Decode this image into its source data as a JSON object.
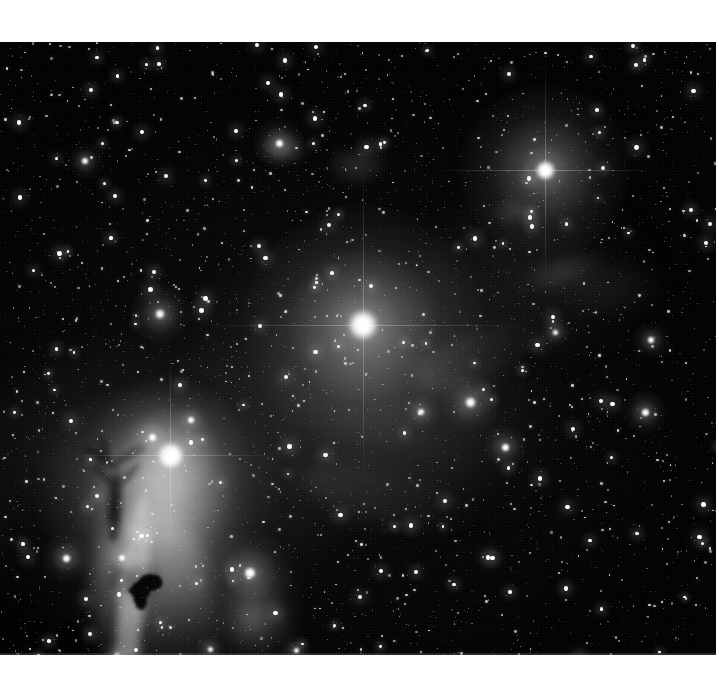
{
  "page": {
    "background_color": "#ffffff",
    "width": 719,
    "height": 699
  },
  "plate": {
    "name": "astrophotograph",
    "subject": "Orion molecular cloud - Flame and Horsehead Nebula region",
    "palette": "grayscale",
    "background_color": "#020202",
    "frame": {
      "x": 0,
      "y": 42,
      "width": 716,
      "height": 613
    },
    "margins": {
      "top": 42,
      "bottom": 44,
      "left": 0,
      "right": 3
    }
  },
  "features": [
    {
      "id": "flame-nebula",
      "label": "Flame Nebula",
      "x": 140,
      "y": 455,
      "kind": "emission-nebula"
    },
    {
      "id": "horsehead-nebula",
      "label": "Horsehead Nebula",
      "x": 145,
      "y": 548,
      "kind": "dark-nebula"
    },
    {
      "id": "ic434-ridge",
      "label": "IC 434 emission ridge",
      "x": 135,
      "y": 500,
      "kind": "emission-ridge"
    },
    {
      "id": "ngc2023",
      "label": "NGC 2023",
      "x": 250,
      "y": 573,
      "kind": "reflection-nebula"
    },
    {
      "id": "bright-star-mid",
      "label": "Bright central star",
      "x": 363,
      "y": 325,
      "kind": "star"
    },
    {
      "id": "bright-star-top",
      "label": "Bright upper-right star",
      "x": 545,
      "y": 170,
      "kind": "star"
    },
    {
      "id": "alnitak",
      "label": "Alnitak",
      "x": 170,
      "y": 455,
      "kind": "star"
    }
  ],
  "bright_stars": [
    {
      "x": 363,
      "y": 283,
      "r": 26,
      "halo": 120,
      "glow": 0.95
    },
    {
      "x": 545,
      "y": 128,
      "r": 17,
      "halo": 86,
      "glow": 0.9
    },
    {
      "x": 170,
      "y": 413,
      "r": 23,
      "halo": 78,
      "glow": 0.95
    },
    {
      "x": 250,
      "y": 531,
      "r": 10,
      "halo": 44,
      "glow": 0.8
    },
    {
      "x": 160,
      "y": 272,
      "r": 8,
      "halo": 30,
      "glow": 0.78
    },
    {
      "x": 152,
      "y": 395,
      "r": 7,
      "halo": 24,
      "glow": 0.72
    },
    {
      "x": 66,
      "y": 516,
      "r": 7,
      "halo": 24,
      "glow": 0.72
    },
    {
      "x": 122,
      "y": 516,
      "r": 6,
      "halo": 20,
      "glow": 0.68
    },
    {
      "x": 470,
      "y": 360,
      "r": 9,
      "halo": 30,
      "glow": 0.78
    },
    {
      "x": 279,
      "y": 101,
      "r": 7,
      "halo": 26,
      "glow": 0.72
    },
    {
      "x": 505,
      "y": 405,
      "r": 7,
      "halo": 22,
      "glow": 0.7
    },
    {
      "x": 85,
      "y": 119,
      "r": 6,
      "halo": 18,
      "glow": 0.66
    },
    {
      "x": 651,
      "y": 298,
      "r": 6,
      "halo": 18,
      "glow": 0.66
    },
    {
      "x": 645,
      "y": 370,
      "r": 7,
      "halo": 22,
      "glow": 0.7
    },
    {
      "x": 421,
      "y": 370,
      "r": 6,
      "halo": 18,
      "glow": 0.64
    },
    {
      "x": 555,
      "y": 290,
      "r": 5,
      "halo": 16,
      "glow": 0.62
    },
    {
      "x": 191,
      "y": 378,
      "r": 6,
      "halo": 18,
      "glow": 0.64
    },
    {
      "x": 117,
      "y": 614,
      "r": 6,
      "halo": 18,
      "glow": 0.64
    },
    {
      "x": 210,
      "y": 607,
      "r": 5,
      "halo": 15,
      "glow": 0.6
    },
    {
      "x": 296,
      "y": 608,
      "r": 5,
      "halo": 15,
      "glow": 0.6
    }
  ],
  "star_field": {
    "description": "Dense Milky Way star field, thousands of point sources",
    "density": "very high",
    "grain": true
  }
}
